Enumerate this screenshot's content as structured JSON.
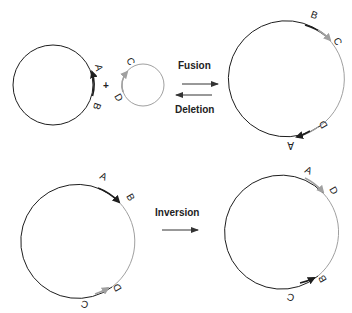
{
  "colors": {
    "dark": "#1e1e1e",
    "gray": "#a0a0a0",
    "background": "#ffffff"
  },
  "top_row": {
    "plus_sign": "+",
    "fusion_label": "Fusion",
    "deletion_label": "Deletion",
    "left_circle": {
      "segments": [
        "A",
        "B"
      ],
      "arrow_color": "dark"
    },
    "small_circle": {
      "segments": [
        "C",
        "D"
      ],
      "arrow_color": "gray"
    },
    "fused_circle": {
      "segments": [
        "B",
        "C",
        "D",
        "A"
      ]
    }
  },
  "bottom_row": {
    "inversion_label": "Inversion",
    "before_circle": {
      "segments": [
        "A",
        "B",
        "D",
        "C"
      ]
    },
    "after_circle": {
      "segments": [
        "A",
        "D",
        "B",
        "C"
      ]
    }
  }
}
